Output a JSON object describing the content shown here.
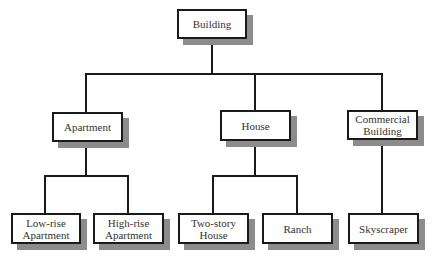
{
  "diagram": {
    "type": "tree",
    "root": {
      "label": "Building",
      "children": [
        {
          "label": "Apartment",
          "children": [
            {
              "label": "Low-rise\nApartment"
            },
            {
              "label": "High-rise\nApartment"
            }
          ]
        },
        {
          "label": "House",
          "children": [
            {
              "label": "Two-story\nHouse"
            },
            {
              "label": "Ranch"
            }
          ]
        },
        {
          "label": "Commercial\nBuilding",
          "children": [
            {
              "label": "Skyscraper"
            }
          ]
        }
      ]
    },
    "nodes": {
      "building": "Building",
      "apartment": "Apartment",
      "house": "House",
      "commercial": "Commercial\nBuilding",
      "lowrise": "Low-rise\nApartment",
      "highrise": "High-rise\nApartment",
      "twostory": "Two-story\nHouse",
      "ranch": "Ranch",
      "skyscraper": "Skyscraper"
    },
    "colors": {
      "line": "#1a1a1a",
      "shadow": "#8c8c8c",
      "box_fill": "#ffffff",
      "text": "#333333"
    }
  }
}
